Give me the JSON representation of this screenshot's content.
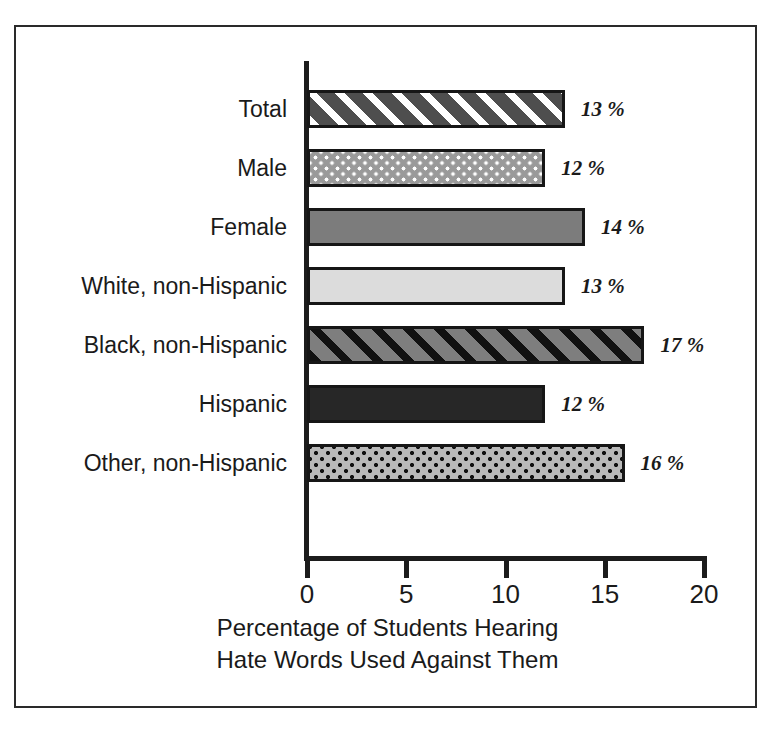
{
  "page": {
    "top_caption_fragment": "                                                                                                     "
  },
  "chart_data": {
    "type": "bar",
    "orientation": "horizontal",
    "title": "",
    "xlabel_line1": "Percentage of Students Hearing",
    "xlabel_line2": "Hate Words Used Against Them",
    "ylabel": "",
    "xlim": [
      0,
      20
    ],
    "xticks": [
      0,
      5,
      10,
      15,
      20
    ],
    "xtick_labels": [
      "0",
      "5",
      "10",
      "15",
      "20"
    ],
    "grid": false,
    "legend": "none",
    "value_suffix": "%",
    "categories": [
      "Total",
      "Male",
      "Female",
      "White, non-Hispanic",
      "Black, non-Hispanic",
      "Hispanic",
      "Other, non-Hispanic"
    ],
    "values": [
      13,
      12,
      14,
      13,
      17,
      12,
      16
    ],
    "value_labels": [
      "13 %",
      "12 %",
      "14 %",
      "13 %",
      "17 %",
      "12 %",
      "16 %"
    ],
    "bar_patterns": [
      "diagonal-stripes-white-on-dark-gray",
      "square-dots-white-on-gray",
      "solid-medium-gray",
      "solid-light-gray",
      "diagonal-stripes-black-on-gray",
      "solid-dark-gray",
      "square-dots-black-on-light-gray"
    ],
    "colors": {
      "bar_outline": "#161616",
      "axis": "#1c1c1c",
      "frame": "#2a2a2a",
      "text": "#1a1a1a",
      "background": "#ffffff",
      "total": "#4e4e4e",
      "male": "#9a9a9a",
      "female": "#7c7c7c",
      "white_non_hispanic": "#dcdcdc",
      "black_non_hispanic": "#7e7e7e",
      "hispanic": "#272727",
      "other_non_hispanic": "#b9b9b9"
    }
  }
}
